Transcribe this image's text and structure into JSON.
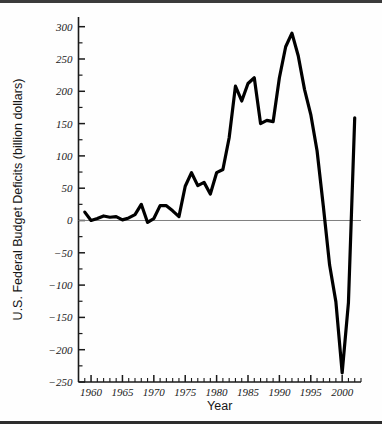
{
  "chart_data": {
    "type": "line",
    "title": "",
    "xlabel": "Year",
    "ylabel": "U.S. Federal Budget Deficits (billion dollars)",
    "xlim": [
      1958,
      2003
    ],
    "ylim": [
      -250,
      315
    ],
    "ytick_step": 50,
    "yminor_step": 25,
    "xtick_step": 5,
    "xminor_step": 1,
    "grid": false,
    "legend": null,
    "zero_line": true,
    "line_color": "#000000",
    "line_width_px": 3.2,
    "axis_color": "#1a1a1a",
    "zero_line_color": "#808080",
    "x_tick_labels": [
      "1960",
      "1965",
      "1970",
      "1975",
      "1980",
      "1985",
      "1990",
      "1995",
      "2000"
    ],
    "x_tick_values": [
      1960,
      1965,
      1970,
      1975,
      1980,
      1985,
      1990,
      1995,
      2000
    ],
    "y_tick_labels": [
      "300",
      "250",
      "200",
      "150",
      "100",
      "50",
      "0",
      "−50",
      "−100",
      "−150",
      "−200",
      "−250"
    ],
    "y_tick_values": [
      300,
      250,
      200,
      150,
      100,
      50,
      0,
      -50,
      -100,
      -150,
      -200,
      -250
    ],
    "x": [
      1959,
      1960,
      1961,
      1962,
      1963,
      1964,
      1965,
      1966,
      1967,
      1968,
      1969,
      1970,
      1971,
      1972,
      1973,
      1974,
      1975,
      1976,
      1977,
      1978,
      1979,
      1980,
      1981,
      1982,
      1983,
      1984,
      1985,
      1986,
      1987,
      1988,
      1989,
      1990,
      1991,
      1992,
      1993,
      1994,
      1995,
      1996,
      1997,
      1998,
      1999,
      2000,
      2001,
      2002
    ],
    "values": [
      13,
      0,
      3,
      7,
      5,
      6,
      1,
      4,
      9,
      25,
      -3,
      3,
      23,
      23,
      15,
      6,
      53,
      74,
      54,
      59,
      41,
      74,
      79,
      128,
      208,
      185,
      212,
      221,
      150,
      155,
      153,
      221,
      269,
      290,
      255,
      203,
      164,
      108,
      22,
      -69,
      -126,
      -236,
      -127,
      159
    ],
    "annotations": []
  },
  "axis": {
    "ylabel": "U.S. Federal Budget Deficits (billion dollars)",
    "xlabel": "Year"
  }
}
